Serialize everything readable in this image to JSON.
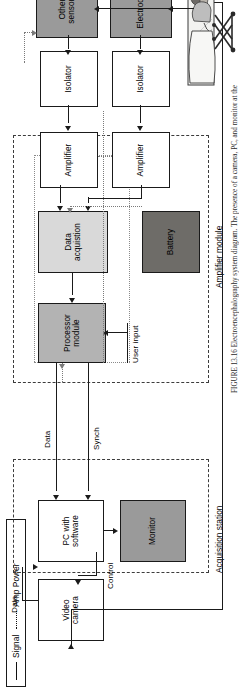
{
  "figure": {
    "caption": "FIGURE 13.16   Electroencephalography system diagram. The presence of a camera, PC, and monitor at the"
  },
  "legend": {
    "signal_label": "Signal",
    "power_label": "Amp Power"
  },
  "groups": {
    "acquisition_station": "Acquisition station",
    "amplifier_module": "Amplifier module"
  },
  "blocks": {
    "video_camera": "Video\ncamera",
    "pc_with_software": "PC with\nsoftware",
    "monitor": "Monitor",
    "processor_module": "Processor\nmodule",
    "data_acquisition": "Data\nacquistion",
    "battery": "Battery",
    "amplifier_1": "Amplifier",
    "amplifier_2": "Amplifier",
    "isolator_1": "Isolator",
    "isolator_2": "Isolator",
    "other_sensors": "Other\nsensors",
    "electrodes": "Electrodes"
  },
  "connections": {
    "data_camera_to_pc": "Data",
    "control_pc_to_camera": "Control",
    "data_processor_to_pc": "Data",
    "synch_processor_to_pc": "Synch",
    "user_input": "User input"
  },
  "colors": {
    "monitor_fill": "#9a9a9a",
    "processor_fill": "#b3b3b3",
    "data_acq_fill": "#d9d9d9",
    "battery_fill": "#6e6c68",
    "sensor_fill": "#9a9a9a",
    "line": "#1a1a1a",
    "power_line": "#7a7a7a"
  }
}
